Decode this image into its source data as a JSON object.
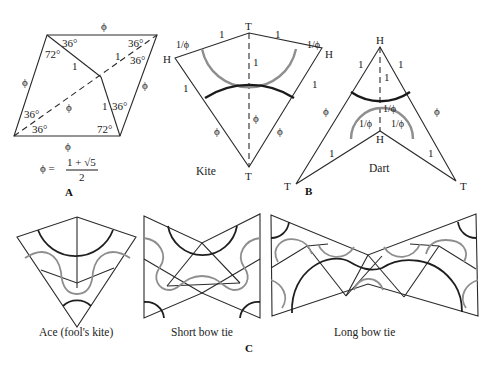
{
  "panels": {
    "A": {
      "label": "A",
      "edge_labels": {
        "top": "ϕ",
        "left": "ϕ",
        "right": "ϕ",
        "bottom": "ϕ",
        "inner_upper": "1",
        "inner_lower": "1",
        "diag_upper": "1",
        "diag_lower": "ϕ"
      },
      "angles": {
        "tl_upper": "36°",
        "tl_lower": "72°",
        "tr_upper": "36°",
        "tr_lower": "36°",
        "bl_upper": "36°",
        "bl_lower": "36°",
        "br_upper": "36°",
        "br_lower": "72°"
      },
      "formula": {
        "lhs": "ϕ =",
        "numerator": "1 + √5",
        "denominator": "2"
      }
    },
    "B": {
      "label": "B",
      "kite": {
        "caption": "Kite",
        "vertices": {
          "top": "T",
          "left": "H",
          "right": "H",
          "bottom": "T"
        },
        "edge_labels": {
          "top_left_short": "1/ϕ",
          "top_left_long": "1",
          "top_right_long": "1",
          "top_right_short": "1/ϕ",
          "axis_upper": "1",
          "axis_lower": "ϕ",
          "left_upper": "1",
          "right_upper": "1",
          "left_lower": "ϕ",
          "right_lower": "ϕ"
        }
      },
      "dart": {
        "caption": "Dart",
        "vertices": {
          "top": "H",
          "left": "T",
          "right": "T",
          "inner": "H"
        },
        "edge_labels": {
          "upper_left": "1",
          "upper_right": "1",
          "axis_upper": "1",
          "axis_lower": "1/ϕ",
          "inner_left": "1/ϕ",
          "inner_right": "1/ϕ",
          "lower_left": "ϕ",
          "lower_right": "ϕ",
          "bottom_left": "1",
          "bottom_right": "1"
        }
      }
    },
    "C": {
      "label": "C",
      "figures": [
        {
          "caption": "Ace (fool's kite)"
        },
        {
          "caption": "Short bow tie"
        },
        {
          "caption": "Long bow tie"
        }
      ]
    }
  },
  "colors": {
    "line": "#2a2a2a",
    "arc_dark": "#1a1a1a",
    "arc_gray": "#8e8e8e",
    "background": "#ffffff"
  }
}
